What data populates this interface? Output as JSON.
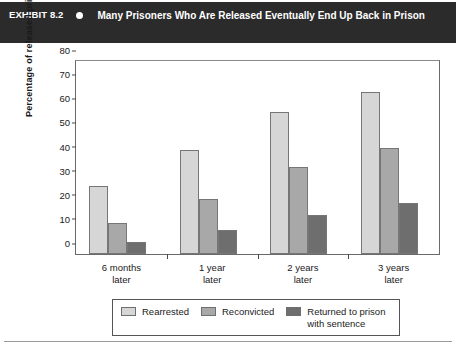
{
  "header": {
    "exhibit_label": "EXHIBIT 8.2",
    "bullet_icon": "bullet-dot",
    "title": "Many Prisoners Who Are Released Eventually End Up Back in Prison",
    "background_color": "#2b2b2b",
    "text_color": "#ffffff"
  },
  "chart_data": {
    "type": "bar",
    "title": "Many Prisoners Who Are Released Eventually End Up Back in Prison",
    "categories": [
      "6 months\nlater",
      "1 year\nlater",
      "2 years\nlater",
      "3 years\nlater"
    ],
    "series": [
      {
        "name": "Rearrested",
        "values": [
          28,
          43,
          59,
          67
        ],
        "color": "#d6d6d6"
      },
      {
        "name": "Reconvicted",
        "values": [
          13,
          23,
          36,
          44
        ],
        "color": "#a8a8a8"
      },
      {
        "name": "Returned to prison\nwith sentence",
        "values": [
          5,
          10,
          16,
          21
        ],
        "color": "#6e6e6e"
      }
    ],
    "xlabel": "",
    "ylabel": "Percentage of released prisoners",
    "ylim": [
      0,
      80
    ],
    "yticks": [
      0,
      10,
      20,
      30,
      40,
      50,
      60,
      70,
      80
    ],
    "grid": false,
    "legend_position": "bottom"
  }
}
